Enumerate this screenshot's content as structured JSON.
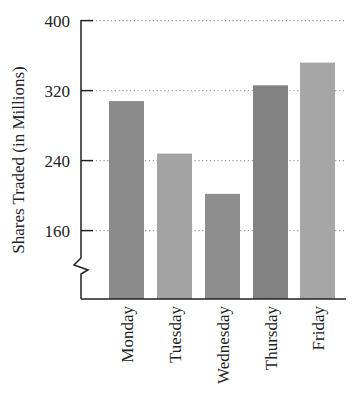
{
  "chart_data": {
    "type": "bar",
    "title": "",
    "xlabel": "",
    "ylabel": "Shares Traded (in Millions)",
    "categories": [
      "Monday",
      "Tuesday",
      "Wednesday",
      "Thursday",
      "Friday"
    ],
    "values": [
      308,
      248,
      202,
      326,
      352
    ],
    "ylim": [
      120,
      400
    ],
    "yticks": [
      160,
      240,
      320,
      400
    ],
    "ytick_labels": [
      "160",
      "240",
      "320",
      "400"
    ],
    "grid": "dotted horizontal at ticks",
    "axis_break": true,
    "bar_colors": [
      "#8a8a8a",
      "#a3a3a3",
      "#8e8e8e",
      "#828282",
      "#a6a6a6"
    ],
    "legend": null
  }
}
